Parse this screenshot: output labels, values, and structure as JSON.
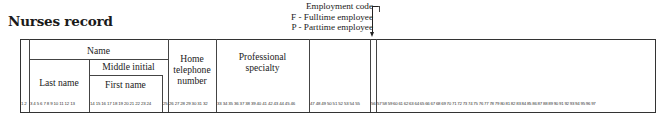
{
  "title": "Nurses record",
  "legend": {
    "heading": "Employment code",
    "options": [
      "F - Fulltime employee",
      "P - Parttime employee"
    ]
  },
  "table": {
    "columns": {
      "name": "Name",
      "middle_initial": "Middle initial",
      "last_name": "Last name",
      "first_name": "First name",
      "home_telephone": [
        "Home",
        "telephone",
        "number"
      ],
      "professional_specialty": [
        "Professional",
        "specialty"
      ]
    },
    "position_numbers": {
      "seg1": "1 2",
      "seg2": "3 4 5 6 7 8 9 10 11 12 13",
      "seg3": "14 15 16 17 18 19 20 21 22 23 24",
      "seg4": "25",
      "seg5": "26 27 28 29 30 31 32",
      "seg6": "33 34 35 36 37 38 39 40 41 42 43 44 45 46",
      "seg7": "47 48 49 50 51 52 53 54 55",
      "seg8": "56",
      "seg9": "57 58 59 60 61 62 63 64 65 66 67 68 69 70 71 72 73 74 75 76 77 78 79 80 81 82 83 84 85 86 87 88 89 90 91 92 93 94 95 96 97"
    }
  }
}
